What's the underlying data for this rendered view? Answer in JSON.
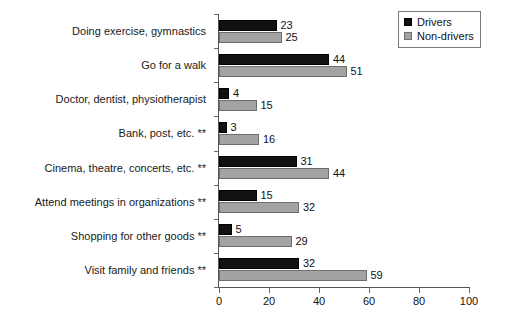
{
  "chart_data": {
    "type": "bar",
    "orientation": "horizontal",
    "title": "",
    "xlabel": "",
    "ylabel": "",
    "xlim": [
      0,
      100
    ],
    "xticks": [
      0,
      20,
      40,
      60,
      80,
      100
    ],
    "xticklabels": [
      "0",
      "20",
      "40",
      "60",
      "80",
      "100"
    ],
    "grid": false,
    "legend_position": "top-right",
    "categories": [
      "Doing exercise, gymnastics",
      "Go for a walk",
      "Doctor, dentist, physiotherapist",
      "Bank, post, etc. **",
      "Cinema, theatre, concerts, etc. **",
      "Attend meetings in organizations **",
      "Shopping for other goods **",
      "Visit family and friends **"
    ],
    "series": [
      {
        "name": "Drivers",
        "color": "#111111",
        "values": [
          23,
          44,
          4,
          3,
          31,
          15,
          5,
          32
        ]
      },
      {
        "name": "Non-drivers",
        "color": "#a3a3a3",
        "values": [
          25,
          51,
          15,
          16,
          44,
          32,
          29,
          59
        ]
      }
    ]
  },
  "legend": {
    "items": [
      {
        "label": "Drivers",
        "swatch": "black-square"
      },
      {
        "label": "Non-drivers",
        "swatch": "gray-square"
      }
    ]
  }
}
